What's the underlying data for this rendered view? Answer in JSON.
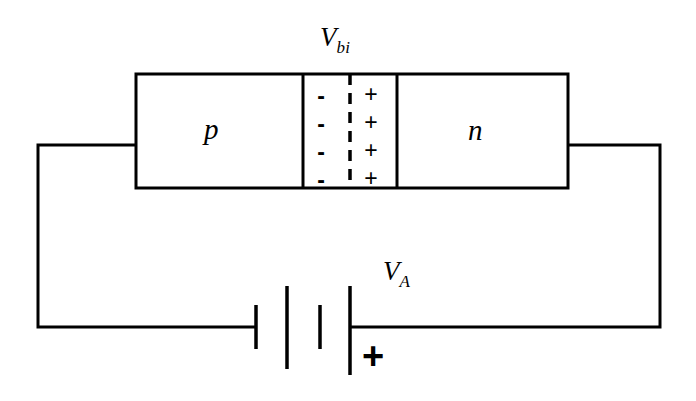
{
  "figure": {
    "line_color": "#000000",
    "background": "#ffffff"
  },
  "diode": {
    "p_region_label": "p",
    "n_region_label": "n",
    "builtin_voltage_label": "V",
    "builtin_voltage_subscript": "bi",
    "depletion_negative_signs": [
      "-",
      "-",
      "-",
      "-"
    ],
    "depletion_positive_signs": [
      "+",
      "+",
      "+",
      "+"
    ],
    "junction_line_style": "dashed"
  },
  "battery": {
    "applied_voltage_label": "V",
    "applied_voltage_subscript": "A",
    "positive_terminal_marker": "+",
    "plates": [
      {
        "type": "negative",
        "length": "short"
      },
      {
        "type": "positive",
        "length": "long"
      },
      {
        "type": "negative",
        "length": "short"
      },
      {
        "type": "positive",
        "length": "long"
      }
    ]
  }
}
